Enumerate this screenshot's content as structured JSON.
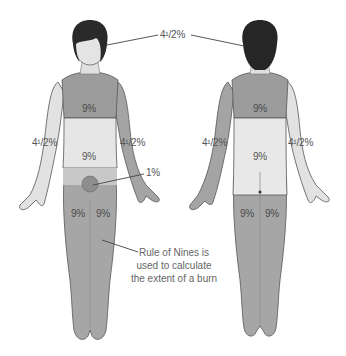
{
  "diagram": {
    "title": "Rule of Nines",
    "caption": [
      "Rule of Nines is",
      "used to calculate",
      "the extent of a burn"
    ],
    "colors": {
      "skin": "#e4e4e4",
      "shaded_dark": "#9c9c9c",
      "shaded_light": "#d2d2d2",
      "hair": "#2a2a2a",
      "outline": "#555555",
      "text": "#555555"
    },
    "front": {
      "head": "4¹/2%",
      "chest": "9%",
      "abdomen": "9%",
      "left_arm": "4¹/2%",
      "right_arm": "4¹/2%",
      "genitals": "1%",
      "left_leg": "9%",
      "right_leg": "9%"
    },
    "back": {
      "head": "4¹/2%",
      "upper_back": "9%",
      "lower_back": "9%",
      "left_arm": "4¹/2%",
      "right_arm": "4¹/2%",
      "left_leg": "9%",
      "right_leg": "9%"
    }
  }
}
